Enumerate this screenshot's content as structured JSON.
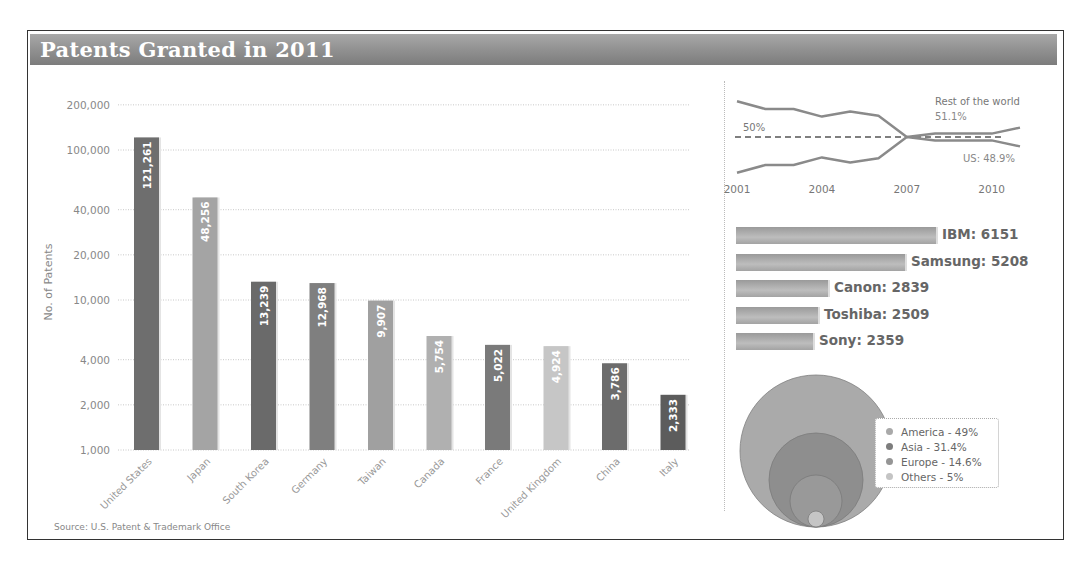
{
  "title": "Patents Granted in 2011",
  "source": "Source: U.S. Patent & Trademark Office",
  "chart_data": [
    {
      "type": "bar",
      "title": "Patents Granted in 2011",
      "xlabel": "",
      "ylabel": "No. of Patents",
      "yscale": "log",
      "ylim": [
        1000,
        200000
      ],
      "yticks": [
        "200,000",
        "100,000",
        "40,000",
        "20,000",
        "10,000",
        "4,000",
        "2,000",
        "1,000"
      ],
      "grid": true,
      "categories": [
        "United States",
        "Japan",
        "South Korea",
        "Germany",
        "Taiwan",
        "Canada",
        "France",
        "United Kingdom",
        "China",
        "Italy"
      ],
      "values": [
        121261,
        48256,
        13239,
        12968,
        9907,
        5754,
        5022,
        4924,
        3786,
        2333
      ],
      "value_labels": [
        "121,261",
        "48,256",
        "13,239",
        "12,968",
        "9,907",
        "5,754",
        "5,022",
        "4,924",
        "3,786",
        "2,333"
      ],
      "colors": [
        "#6e6e6e",
        "#a4a4a4",
        "#6a6a6a",
        "#7f7f7f",
        "#a0a0a0",
        "#b0b0b0",
        "#7a7a7a",
        "#c6c6c6",
        "#6c6c6c",
        "#5c5c5c"
      ]
    },
    {
      "type": "line",
      "title": "US vs Rest of the world share",
      "x": [
        2001,
        2002,
        2003,
        2004,
        2005,
        2006,
        2007,
        2008,
        2009,
        2010,
        2011
      ],
      "xticks": [
        "2001",
        "2004",
        "2007",
        "2010"
      ],
      "series": [
        {
          "name": "Rest of the world",
          "label": "Rest of the world",
          "end_label": "51.1%",
          "values": [
            54.2,
            53.3,
            53.3,
            52.4,
            53.0,
            52.5,
            50.0,
            50.4,
            50.4,
            50.4,
            51.1
          ]
        },
        {
          "name": "US",
          "label": "US: 48.9%",
          "values": [
            45.8,
            46.7,
            46.7,
            47.6,
            47.0,
            47.5,
            50.0,
            49.6,
            49.6,
            49.6,
            48.9
          ]
        }
      ],
      "reference_line": {
        "value": 50,
        "label": "50%",
        "style": "dashed"
      }
    },
    {
      "type": "bar",
      "orientation": "horizontal",
      "title": "Top companies",
      "categories": [
        "IBM",
        "Samsung",
        "Canon",
        "Toshiba",
        "Sony"
      ],
      "values": [
        6151,
        5208,
        2839,
        2509,
        2359
      ],
      "labels": [
        "IBM: 6151",
        "Samsung: 5208",
        "Canon: 2839",
        "Toshiba: 2509",
        "Sony: 2359"
      ]
    },
    {
      "type": "pie",
      "style": "nested-circles",
      "categories": [
        "America",
        "Asia",
        "Europe",
        "Others"
      ],
      "values": [
        49,
        31.4,
        14.6,
        5
      ],
      "legend": [
        "America - 49%",
        "Asia - 31.4%",
        "Europe - 14.6%",
        "Others - 5%"
      ],
      "legend_position": "right",
      "colors": [
        "#a9a9a9",
        "#8a8a8a",
        "#9c9c9c",
        "#c0c0c0"
      ]
    }
  ]
}
